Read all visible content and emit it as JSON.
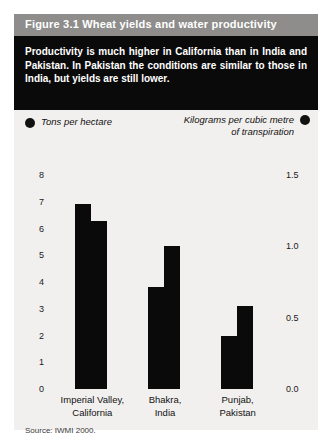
{
  "figure": {
    "header": "Figure 3.1  Wheat yields and water productivity",
    "summary": "Productivity is much higher in California than in India and Pakistan. In Pakistan the conditions are similar to those in India, but yields are still lower.",
    "source": "Source: IWMI 2000."
  },
  "chart_data": {
    "type": "bar",
    "title": "Wheat yields and water productivity",
    "categories": [
      "Imperial Valley, California",
      "Bhakra, India",
      "Punjab, Pakistan"
    ],
    "category_lines": [
      [
        "Imperial Valley,",
        "California"
      ],
      [
        "Bhakra,",
        "India"
      ],
      [
        "Punjab,",
        "Pakistan"
      ]
    ],
    "series": [
      {
        "name": "Tons per hectare",
        "axis": "left",
        "values": [
          6.9,
          3.8,
          2.0
        ]
      },
      {
        "name": "Kilograms per cubic metre of transpiration",
        "axis": "right",
        "values": [
          1.18,
          1.0,
          0.58
        ]
      }
    ],
    "legend": [
      {
        "label": "Tons per hectare",
        "marker": "filled-circle",
        "position": "left"
      },
      {
        "label_line1": "Kilograms per cubic metre",
        "label_line2": "of transpiration",
        "marker": "filled-circle",
        "position": "right"
      }
    ],
    "left_axis": {
      "label": "Tons per hectare",
      "ticks": [
        "0",
        "1",
        "2",
        "3",
        "4",
        "5",
        "6",
        "7",
        "8"
      ],
      "tick_values": [
        0,
        1,
        2,
        3,
        4,
        5,
        6,
        7,
        8
      ],
      "ylim": [
        0,
        8
      ]
    },
    "right_axis": {
      "label": "Kilograms per cubic metre of transpiration",
      "ticks": [
        "0.0",
        "0.5",
        "1.0",
        "1.5"
      ],
      "tick_values": [
        0.0,
        0.5,
        1.0,
        1.5
      ],
      "ylim": [
        0,
        1.5
      ]
    },
    "grid": false,
    "legend_position": "top",
    "bar_color": "#0a0a0a"
  },
  "colors": {
    "header_bg": "#8e8d8b",
    "panel_bg": "#0a0a0a",
    "figure_bg": "#f2f0ee",
    "bar": "#0a0a0a",
    "text_light": "#ffffff",
    "text_dark": "#111111"
  }
}
